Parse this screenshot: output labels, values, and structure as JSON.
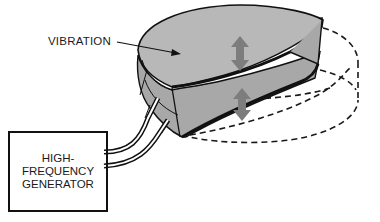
{
  "diagram": {
    "labels": {
      "vibration": "VIBRATION",
      "generator_lines": [
        "HIGH-",
        "FREQUENCY",
        "GENERATOR"
      ]
    },
    "colors": {
      "disk_fill": "#b4b4b4",
      "disk_side": "#a8a8a8",
      "outline": "#111111",
      "arrow": "#7d7d7d",
      "dashed": "#1a1a1a",
      "background": "#ffffff"
    },
    "components": [
      {
        "id": "vibrating-disk",
        "type": "crescent-slab",
        "note": "gray top surface with cut-out"
      },
      {
        "id": "rest-position-cylinder",
        "type": "dashed-outline"
      },
      {
        "id": "vibration-arrows",
        "count": 2,
        "type": "double-headed"
      },
      {
        "id": "cable",
        "type": "double-wire",
        "from": "generator",
        "to": "vibrating-disk"
      },
      {
        "id": "generator",
        "type": "box"
      }
    ]
  }
}
